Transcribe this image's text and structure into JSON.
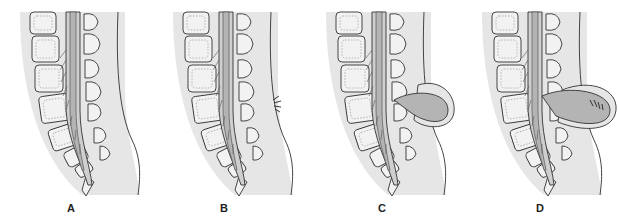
{
  "figure": {
    "colors": {
      "background": "#ffffff",
      "body_tissue": "#e6e6e6",
      "cord": "#b4b4b4",
      "csf": "#cfcfcf",
      "bone": "#f2f2f2",
      "outline": "#333333"
    },
    "panels": [
      {
        "label": "A",
        "variant": "normal"
      },
      {
        "label": "B",
        "variant": "tuft-of-hair"
      },
      {
        "label": "C",
        "variant": "fluid-sac"
      },
      {
        "label": "D",
        "variant": "sac-with-neural-tissue"
      }
    ]
  }
}
